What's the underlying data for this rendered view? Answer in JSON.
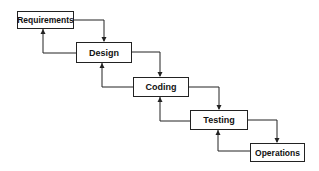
{
  "diagram": {
    "type": "waterfall-model",
    "stages": [
      {
        "label": "Requirements",
        "x": 17,
        "y": 11,
        "w": 57,
        "h": 18
      },
      {
        "label": "Design",
        "x": 76,
        "y": 42,
        "w": 56,
        "h": 21
      },
      {
        "label": "Coding",
        "x": 133,
        "y": 77,
        "w": 56,
        "h": 20
      },
      {
        "label": "Testing",
        "x": 190,
        "y": 110,
        "w": 58,
        "h": 20
      },
      {
        "label": "Operations",
        "x": 250,
        "y": 143,
        "w": 55,
        "h": 19
      }
    ],
    "line_color": "#222222"
  }
}
